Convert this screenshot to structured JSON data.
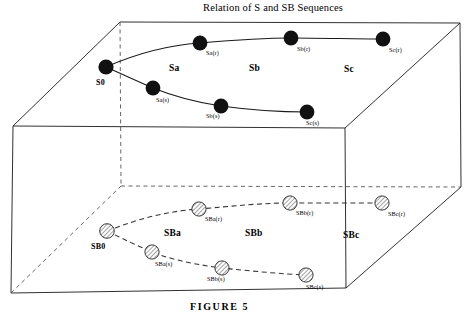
{
  "figure": {
    "title": "Relation of S and SB Sequences",
    "caption": "FIGURE 5",
    "colors": {
      "ink": "#000000",
      "line": "#1a1a1a",
      "background": "#ffffff",
      "solid_marker_fill": "#111111",
      "hatched_marker_fill": "#ffffff",
      "hatch_stroke": "#333333"
    }
  },
  "top_plane": {
    "region_labels": [
      {
        "name": "region-label-sa",
        "text": "Sa",
        "x": 176,
        "y": 69
      },
      {
        "name": "region-label-sb",
        "text": "Sb",
        "x": 256,
        "y": 69
      },
      {
        "name": "region-label-sc",
        "text": "Sc",
        "x": 350,
        "y": 70
      }
    ],
    "origin_node": {
      "id": "S0",
      "label": "S0",
      "x": 106,
      "y": 67,
      "label_x": 98,
      "label_y": 82
    },
    "upper_curve": {
      "name": "s-r-curve",
      "style": "solid",
      "nodes": [
        {
          "id": "Sa(r)",
          "label": "Sa(r)",
          "x": 200,
          "y": 43,
          "label_x": 206,
          "label_y": 56
        },
        {
          "id": "Sb(r)",
          "label": "Sb(r)",
          "x": 291,
          "y": 38,
          "label_x": 297,
          "label_y": 52
        },
        {
          "id": "Sc(r)",
          "label": "Sc(r)",
          "x": 383,
          "y": 39,
          "label_x": 389,
          "label_y": 53
        }
      ]
    },
    "lower_curve": {
      "name": "s-s-curve",
      "style": "solid",
      "nodes": [
        {
          "id": "Sa(s)",
          "label": "Sa(s)",
          "x": 153,
          "y": 88,
          "label_x": 157,
          "label_y": 103
        },
        {
          "id": "Sb(s)",
          "label": "Sb(s)",
          "x": 221,
          "y": 106,
          "label_x": 207,
          "label_y": 119
        },
        {
          "id": "Sc(s)",
          "label": "Sc(s)",
          "x": 307,
          "y": 112,
          "label_x": 307,
          "label_y": 126
        }
      ]
    }
  },
  "bottom_plane": {
    "region_labels": [
      {
        "name": "region-label-sba",
        "text": "SBa",
        "x": 173,
        "y": 234
      },
      {
        "name": "region-label-sbb",
        "text": "SBb",
        "x": 254,
        "y": 234
      },
      {
        "name": "region-label-sbc",
        "text": "SBc",
        "x": 352,
        "y": 236
      }
    ],
    "origin_node": {
      "id": "SB0",
      "label": "SB0",
      "x": 107,
      "y": 231,
      "label_x": 95,
      "label_y": 247
    },
    "upper_curve": {
      "name": "sb-r-curve",
      "style": "dashed",
      "nodes": [
        {
          "id": "SBa(r)",
          "label": "SBa(r)",
          "x": 199,
          "y": 209,
          "label_x": 205,
          "label_y": 222
        },
        {
          "id": "SBb(r)",
          "label": "SBb(r)",
          "x": 290,
          "y": 203,
          "label_x": 296,
          "label_y": 216
        },
        {
          "id": "SBc(r)",
          "label": "SBc(r)",
          "x": 382,
          "y": 203,
          "label_x": 388,
          "label_y": 217
        }
      ]
    },
    "lower_curve": {
      "name": "sb-s-curve",
      "style": "dashed",
      "nodes": [
        {
          "id": "SBa(s)",
          "label": "SBa(s)",
          "x": 152,
          "y": 252,
          "label_x": 156,
          "label_y": 267
        },
        {
          "id": "SBb(s)",
          "label": "SBb(s)",
          "x": 222,
          "y": 268,
          "label_x": 208,
          "label_y": 282
        },
        {
          "id": "SBc(s)",
          "label": "SBc(s)",
          "x": 306,
          "y": 275,
          "label_x": 307,
          "label_y": 290
        }
      ]
    }
  },
  "geometry": {
    "top_face": {
      "back_left": [
        120,
        22
      ],
      "back_right": [
        460,
        23
      ],
      "front_right": [
        345,
        128
      ],
      "front_left": [
        13,
        126
      ]
    },
    "bottom_face": {
      "back_left": [
        121,
        186
      ],
      "back_right": [
        461,
        187
      ],
      "front_right": [
        346,
        288
      ],
      "front_left": [
        11,
        293
      ]
    },
    "vertical_edges": {
      "front_left": [
        [
          13,
          126
        ],
        [
          11,
          293
        ]
      ],
      "front_right": [
        [
          345,
          128
        ],
        [
          346,
          288
        ]
      ],
      "back_left": [
        [
          120,
          22
        ],
        [
          121,
          186
        ]
      ],
      "back_right": [
        [
          460,
          23
        ],
        [
          461,
          187
        ]
      ]
    }
  }
}
